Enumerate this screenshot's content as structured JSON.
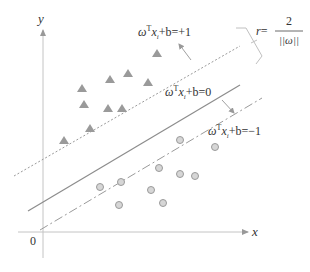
{
  "diagram": {
    "axes": {
      "x_label": "x",
      "y_label": "y",
      "origin_label": "0"
    },
    "hyperplanes": {
      "upper": {
        "label_main": "ωᵀxᵢ+b=+1",
        "omega": "ω",
        "sup": "T",
        "x": "x",
        "sub": "i",
        "rest": "+b=+1",
        "style": "dotted"
      },
      "middle": {
        "label_main": "ωᵀxᵢ+b=0",
        "omega": "ω",
        "sup": "T",
        "x": "x",
        "sub": "i",
        "rest": "+b=0",
        "style": "solid"
      },
      "lower": {
        "label_main": "ωᵀxᵢ+b=−1",
        "omega": "ω",
        "sup": "T",
        "x": "x",
        "sub": "i",
        "rest": "+b=−1",
        "style": "dash-dot"
      }
    },
    "margin": {
      "lhs": "r=",
      "numerator": "2",
      "denominator": "||ω||"
    },
    "classes": {
      "positive": {
        "marker": "triangle",
        "count": 10,
        "color": "#9a9a9a"
      },
      "negative": {
        "marker": "circle",
        "count": 10,
        "color": "#c8c8c8"
      }
    },
    "colors": {
      "line": "#8c8c8c",
      "axis": "#bdbdbd",
      "text": "#333333"
    }
  }
}
